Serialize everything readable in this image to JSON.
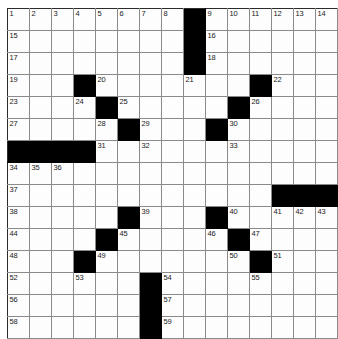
{
  "puzzle": {
    "kind": "crossword-grid",
    "rows": 15,
    "columns": 15,
    "cell_size_px": 21,
    "colors": {
      "block": "#000000",
      "cell": "#fdfdfd",
      "grid_line": "#8a8a8a",
      "number_text": "#1a1a1a",
      "background": "#ffffff"
    },
    "highest_number": 59,
    "grid": [
      [
        {
          "block": false,
          "num": "1"
        },
        {
          "block": false,
          "num": "2"
        },
        {
          "block": false,
          "num": "3"
        },
        {
          "block": false,
          "num": "4"
        },
        {
          "block": false,
          "num": "5"
        },
        {
          "block": false,
          "num": "6"
        },
        {
          "block": false,
          "num": "7"
        },
        {
          "block": false,
          "num": "8"
        },
        {
          "block": true,
          "num": ""
        },
        {
          "block": false,
          "num": "9"
        },
        {
          "block": false,
          "num": "10"
        },
        {
          "block": false,
          "num": "11"
        },
        {
          "block": false,
          "num": "12"
        },
        {
          "block": false,
          "num": "13"
        },
        {
          "block": false,
          "num": "14"
        }
      ],
      [
        {
          "block": false,
          "num": "15"
        },
        {
          "block": false,
          "num": ""
        },
        {
          "block": false,
          "num": ""
        },
        {
          "block": false,
          "num": ""
        },
        {
          "block": false,
          "num": ""
        },
        {
          "block": false,
          "num": ""
        },
        {
          "block": false,
          "num": ""
        },
        {
          "block": false,
          "num": ""
        },
        {
          "block": true,
          "num": ""
        },
        {
          "block": false,
          "num": "16"
        },
        {
          "block": false,
          "num": ""
        },
        {
          "block": false,
          "num": ""
        },
        {
          "block": false,
          "num": ""
        },
        {
          "block": false,
          "num": ""
        },
        {
          "block": false,
          "num": ""
        }
      ],
      [
        {
          "block": false,
          "num": "17"
        },
        {
          "block": false,
          "num": ""
        },
        {
          "block": false,
          "num": ""
        },
        {
          "block": false,
          "num": ""
        },
        {
          "block": false,
          "num": ""
        },
        {
          "block": false,
          "num": ""
        },
        {
          "block": false,
          "num": ""
        },
        {
          "block": false,
          "num": ""
        },
        {
          "block": true,
          "num": ""
        },
        {
          "block": false,
          "num": "18"
        },
        {
          "block": false,
          "num": ""
        },
        {
          "block": false,
          "num": ""
        },
        {
          "block": false,
          "num": ""
        },
        {
          "block": false,
          "num": ""
        },
        {
          "block": false,
          "num": ""
        }
      ],
      [
        {
          "block": false,
          "num": "19"
        },
        {
          "block": false,
          "num": ""
        },
        {
          "block": false,
          "num": ""
        },
        {
          "block": true,
          "num": ""
        },
        {
          "block": false,
          "num": "20"
        },
        {
          "block": false,
          "num": ""
        },
        {
          "block": false,
          "num": ""
        },
        {
          "block": false,
          "num": ""
        },
        {
          "block": false,
          "num": "21"
        },
        {
          "block": false,
          "num": ""
        },
        {
          "block": false,
          "num": ""
        },
        {
          "block": true,
          "num": ""
        },
        {
          "block": false,
          "num": "22"
        },
        {
          "block": false,
          "num": ""
        },
        {
          "block": false,
          "num": ""
        }
      ],
      [
        {
          "block": false,
          "num": "23"
        },
        {
          "block": false,
          "num": ""
        },
        {
          "block": false,
          "num": ""
        },
        {
          "block": false,
          "num": "24"
        },
        {
          "block": true,
          "num": ""
        },
        {
          "block": false,
          "num": "25"
        },
        {
          "block": false,
          "num": ""
        },
        {
          "block": false,
          "num": ""
        },
        {
          "block": false,
          "num": ""
        },
        {
          "block": false,
          "num": ""
        },
        {
          "block": true,
          "num": ""
        },
        {
          "block": false,
          "num": "26"
        },
        {
          "block": false,
          "num": ""
        },
        {
          "block": false,
          "num": ""
        },
        {
          "block": false,
          "num": ""
        }
      ],
      [
        {
          "block": false,
          "num": "27"
        },
        {
          "block": false,
          "num": ""
        },
        {
          "block": false,
          "num": ""
        },
        {
          "block": false,
          "num": ""
        },
        {
          "block": false,
          "num": "28"
        },
        {
          "block": true,
          "num": ""
        },
        {
          "block": false,
          "num": "29"
        },
        {
          "block": false,
          "num": ""
        },
        {
          "block": false,
          "num": ""
        },
        {
          "block": true,
          "num": ""
        },
        {
          "block": false,
          "num": "30"
        },
        {
          "block": false,
          "num": ""
        },
        {
          "block": false,
          "num": ""
        },
        {
          "block": false,
          "num": ""
        },
        {
          "block": false,
          "num": ""
        }
      ],
      [
        {
          "block": true,
          "num": ""
        },
        {
          "block": true,
          "num": ""
        },
        {
          "block": true,
          "num": ""
        },
        {
          "block": true,
          "num": ""
        },
        {
          "block": false,
          "num": "31"
        },
        {
          "block": false,
          "num": ""
        },
        {
          "block": false,
          "num": "32"
        },
        {
          "block": false,
          "num": ""
        },
        {
          "block": false,
          "num": ""
        },
        {
          "block": false,
          "num": ""
        },
        {
          "block": false,
          "num": "33"
        },
        {
          "block": false,
          "num": ""
        },
        {
          "block": false,
          "num": ""
        },
        {
          "block": false,
          "num": ""
        },
        {
          "block": false,
          "num": ""
        }
      ],
      [
        {
          "block": false,
          "num": "34"
        },
        {
          "block": false,
          "num": "35"
        },
        {
          "block": false,
          "num": "36"
        },
        {
          "block": false,
          "num": ""
        },
        {
          "block": false,
          "num": ""
        },
        {
          "block": false,
          "num": ""
        },
        {
          "block": false,
          "num": ""
        },
        {
          "block": false,
          "num": ""
        },
        {
          "block": false,
          "num": ""
        },
        {
          "block": false,
          "num": ""
        },
        {
          "block": false,
          "num": ""
        },
        {
          "block": false,
          "num": ""
        },
        {
          "block": false,
          "num": ""
        },
        {
          "block": false,
          "num": ""
        },
        {
          "block": false,
          "num": ""
        }
      ],
      [
        {
          "block": false,
          "num": "37"
        },
        {
          "block": false,
          "num": ""
        },
        {
          "block": false,
          "num": ""
        },
        {
          "block": false,
          "num": ""
        },
        {
          "block": false,
          "num": ""
        },
        {
          "block": false,
          "num": ""
        },
        {
          "block": false,
          "num": ""
        },
        {
          "block": false,
          "num": ""
        },
        {
          "block": false,
          "num": ""
        },
        {
          "block": false,
          "num": ""
        },
        {
          "block": false,
          "num": ""
        },
        {
          "block": false,
          "num": ""
        },
        {
          "block": true,
          "num": ""
        },
        {
          "block": true,
          "num": ""
        },
        {
          "block": true,
          "num": ""
        }
      ],
      [
        {
          "block": false,
          "num": "38"
        },
        {
          "block": false,
          "num": ""
        },
        {
          "block": false,
          "num": ""
        },
        {
          "block": false,
          "num": ""
        },
        {
          "block": false,
          "num": ""
        },
        {
          "block": true,
          "num": ""
        },
        {
          "block": false,
          "num": "39"
        },
        {
          "block": false,
          "num": ""
        },
        {
          "block": false,
          "num": ""
        },
        {
          "block": true,
          "num": ""
        },
        {
          "block": false,
          "num": "40"
        },
        {
          "block": false,
          "num": ""
        },
        {
          "block": false,
          "num": "41"
        },
        {
          "block": false,
          "num": "42"
        },
        {
          "block": false,
          "num": "43"
        }
      ],
      [
        {
          "block": false,
          "num": "44"
        },
        {
          "block": false,
          "num": ""
        },
        {
          "block": false,
          "num": ""
        },
        {
          "block": false,
          "num": ""
        },
        {
          "block": true,
          "num": ""
        },
        {
          "block": false,
          "num": "45"
        },
        {
          "block": false,
          "num": ""
        },
        {
          "block": false,
          "num": ""
        },
        {
          "block": false,
          "num": ""
        },
        {
          "block": false,
          "num": "46"
        },
        {
          "block": true,
          "num": ""
        },
        {
          "block": false,
          "num": "47"
        },
        {
          "block": false,
          "num": ""
        },
        {
          "block": false,
          "num": ""
        },
        {
          "block": false,
          "num": ""
        }
      ],
      [
        {
          "block": false,
          "num": "48"
        },
        {
          "block": false,
          "num": ""
        },
        {
          "block": false,
          "num": ""
        },
        {
          "block": true,
          "num": ""
        },
        {
          "block": false,
          "num": "49"
        },
        {
          "block": false,
          "num": ""
        },
        {
          "block": false,
          "num": ""
        },
        {
          "block": false,
          "num": ""
        },
        {
          "block": false,
          "num": ""
        },
        {
          "block": false,
          "num": ""
        },
        {
          "block": false,
          "num": "50"
        },
        {
          "block": true,
          "num": ""
        },
        {
          "block": false,
          "num": "51"
        },
        {
          "block": false,
          "num": ""
        },
        {
          "block": false,
          "num": ""
        }
      ],
      [
        {
          "block": false,
          "num": "52"
        },
        {
          "block": false,
          "num": ""
        },
        {
          "block": false,
          "num": ""
        },
        {
          "block": false,
          "num": "53"
        },
        {
          "block": false,
          "num": ""
        },
        {
          "block": false,
          "num": ""
        },
        {
          "block": true,
          "num": ""
        },
        {
          "block": false,
          "num": "54"
        },
        {
          "block": false,
          "num": ""
        },
        {
          "block": false,
          "num": ""
        },
        {
          "block": false,
          "num": ""
        },
        {
          "block": false,
          "num": "55"
        },
        {
          "block": false,
          "num": ""
        },
        {
          "block": false,
          "num": ""
        },
        {
          "block": false,
          "num": ""
        }
      ],
      [
        {
          "block": false,
          "num": "56"
        },
        {
          "block": false,
          "num": ""
        },
        {
          "block": false,
          "num": ""
        },
        {
          "block": false,
          "num": ""
        },
        {
          "block": false,
          "num": ""
        },
        {
          "block": false,
          "num": ""
        },
        {
          "block": true,
          "num": ""
        },
        {
          "block": false,
          "num": "57"
        },
        {
          "block": false,
          "num": ""
        },
        {
          "block": false,
          "num": ""
        },
        {
          "block": false,
          "num": ""
        },
        {
          "block": false,
          "num": ""
        },
        {
          "block": false,
          "num": ""
        },
        {
          "block": false,
          "num": ""
        },
        {
          "block": false,
          "num": ""
        }
      ],
      [
        {
          "block": false,
          "num": "58"
        },
        {
          "block": false,
          "num": ""
        },
        {
          "block": false,
          "num": ""
        },
        {
          "block": false,
          "num": ""
        },
        {
          "block": false,
          "num": ""
        },
        {
          "block": false,
          "num": ""
        },
        {
          "block": true,
          "num": ""
        },
        {
          "block": false,
          "num": "59"
        },
        {
          "block": false,
          "num": ""
        },
        {
          "block": false,
          "num": ""
        },
        {
          "block": false,
          "num": ""
        },
        {
          "block": false,
          "num": ""
        },
        {
          "block": false,
          "num": ""
        },
        {
          "block": false,
          "num": ""
        },
        {
          "block": false,
          "num": ""
        }
      ]
    ]
  }
}
